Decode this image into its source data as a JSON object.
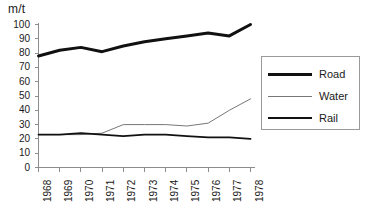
{
  "chart_data": {
    "type": "line",
    "title": "",
    "subtitle": "",
    "xlabel": "",
    "ylabel": "m/t",
    "unit_label": "m/t",
    "categories": [
      "1968",
      "1969",
      "1970",
      "1971",
      "1972",
      "1973",
      "1974",
      "1975",
      "1976",
      "1977",
      "1978"
    ],
    "x": [
      1968,
      1969,
      1970,
      1971,
      1972,
      1973,
      1974,
      1975,
      1976,
      1977,
      1978
    ],
    "xlim": [
      1968,
      1978
    ],
    "ylim": [
      0,
      100
    ],
    "y_ticks": [
      0,
      10,
      20,
      30,
      40,
      50,
      60,
      70,
      80,
      90,
      100
    ],
    "y_tick_labels": [
      "0",
      "10",
      "20",
      "30",
      "40",
      "50",
      "60",
      "70",
      "80",
      "90",
      "100"
    ],
    "x_tick_labels": [
      "1968",
      "1969",
      "1970",
      "1971",
      "1972",
      "1973",
      "1974",
      "1975",
      "1976",
      "1977",
      "1978"
    ],
    "grid": false,
    "legend_position": "right",
    "series": [
      {
        "name": "Road",
        "color": "#111111",
        "width": 3.0,
        "values": [
          78,
          82,
          84,
          81,
          85,
          88,
          90,
          92,
          94,
          92,
          100
        ]
      },
      {
        "name": "Water",
        "color": "#777777",
        "width": 1.0,
        "values": [
          23,
          23,
          23,
          24,
          30,
          30,
          30,
          29,
          31,
          40,
          48
        ]
      },
      {
        "name": "Rail",
        "color": "#111111",
        "width": 1.8,
        "values": [
          23,
          23,
          24,
          23,
          22,
          23,
          23,
          22,
          21,
          21,
          20
        ]
      }
    ]
  },
  "legend": {
    "entries": [
      {
        "label": "Road"
      },
      {
        "label": "Water"
      },
      {
        "label": "Rail"
      }
    ]
  },
  "axes": {
    "unit": "m/t"
  }
}
